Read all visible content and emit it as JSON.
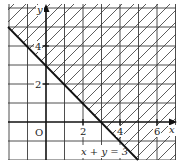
{
  "diagram": {
    "type": "inequality-graph",
    "line_label": "x + y = 3",
    "x_axis_label": "x",
    "y_axis_label": "y",
    "origin_label": "O",
    "x_tick_labels": [
      "2",
      "4",
      "6"
    ],
    "y_tick_labels": [
      "2",
      "4"
    ],
    "shaded_region": "x + y ≥ 3",
    "x_range": [
      -2,
      7
    ],
    "y_range": [
      -2,
      6
    ],
    "colors": {
      "line": "#1a1a1a",
      "grid": "#3a3a3a",
      "hatch": "#333333",
      "background": "#ffffff"
    }
  }
}
